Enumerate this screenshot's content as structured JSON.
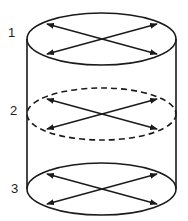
{
  "diagram": {
    "title": "",
    "colors": {
      "stroke": "#1a1a1a",
      "background": "#ffffff"
    },
    "cylinder": {
      "left_x": 27,
      "right_x": 176,
      "top_cy": 39,
      "bottom_cy": 189,
      "rx": 74.5,
      "ry": 26
    },
    "sections": [
      {
        "label": "1",
        "cy": 39,
        "style": "solid",
        "label_x": 8,
        "label_y": 26
      },
      {
        "label": "2",
        "cy": 114,
        "style": "dashed",
        "label_x": 10,
        "label_y": 104
      },
      {
        "label": "3",
        "cy": 189,
        "style": "solid",
        "label_x": 11,
        "label_y": 182
      }
    ],
    "arrows": "double-headed diagonals crossing at center of each section"
  }
}
